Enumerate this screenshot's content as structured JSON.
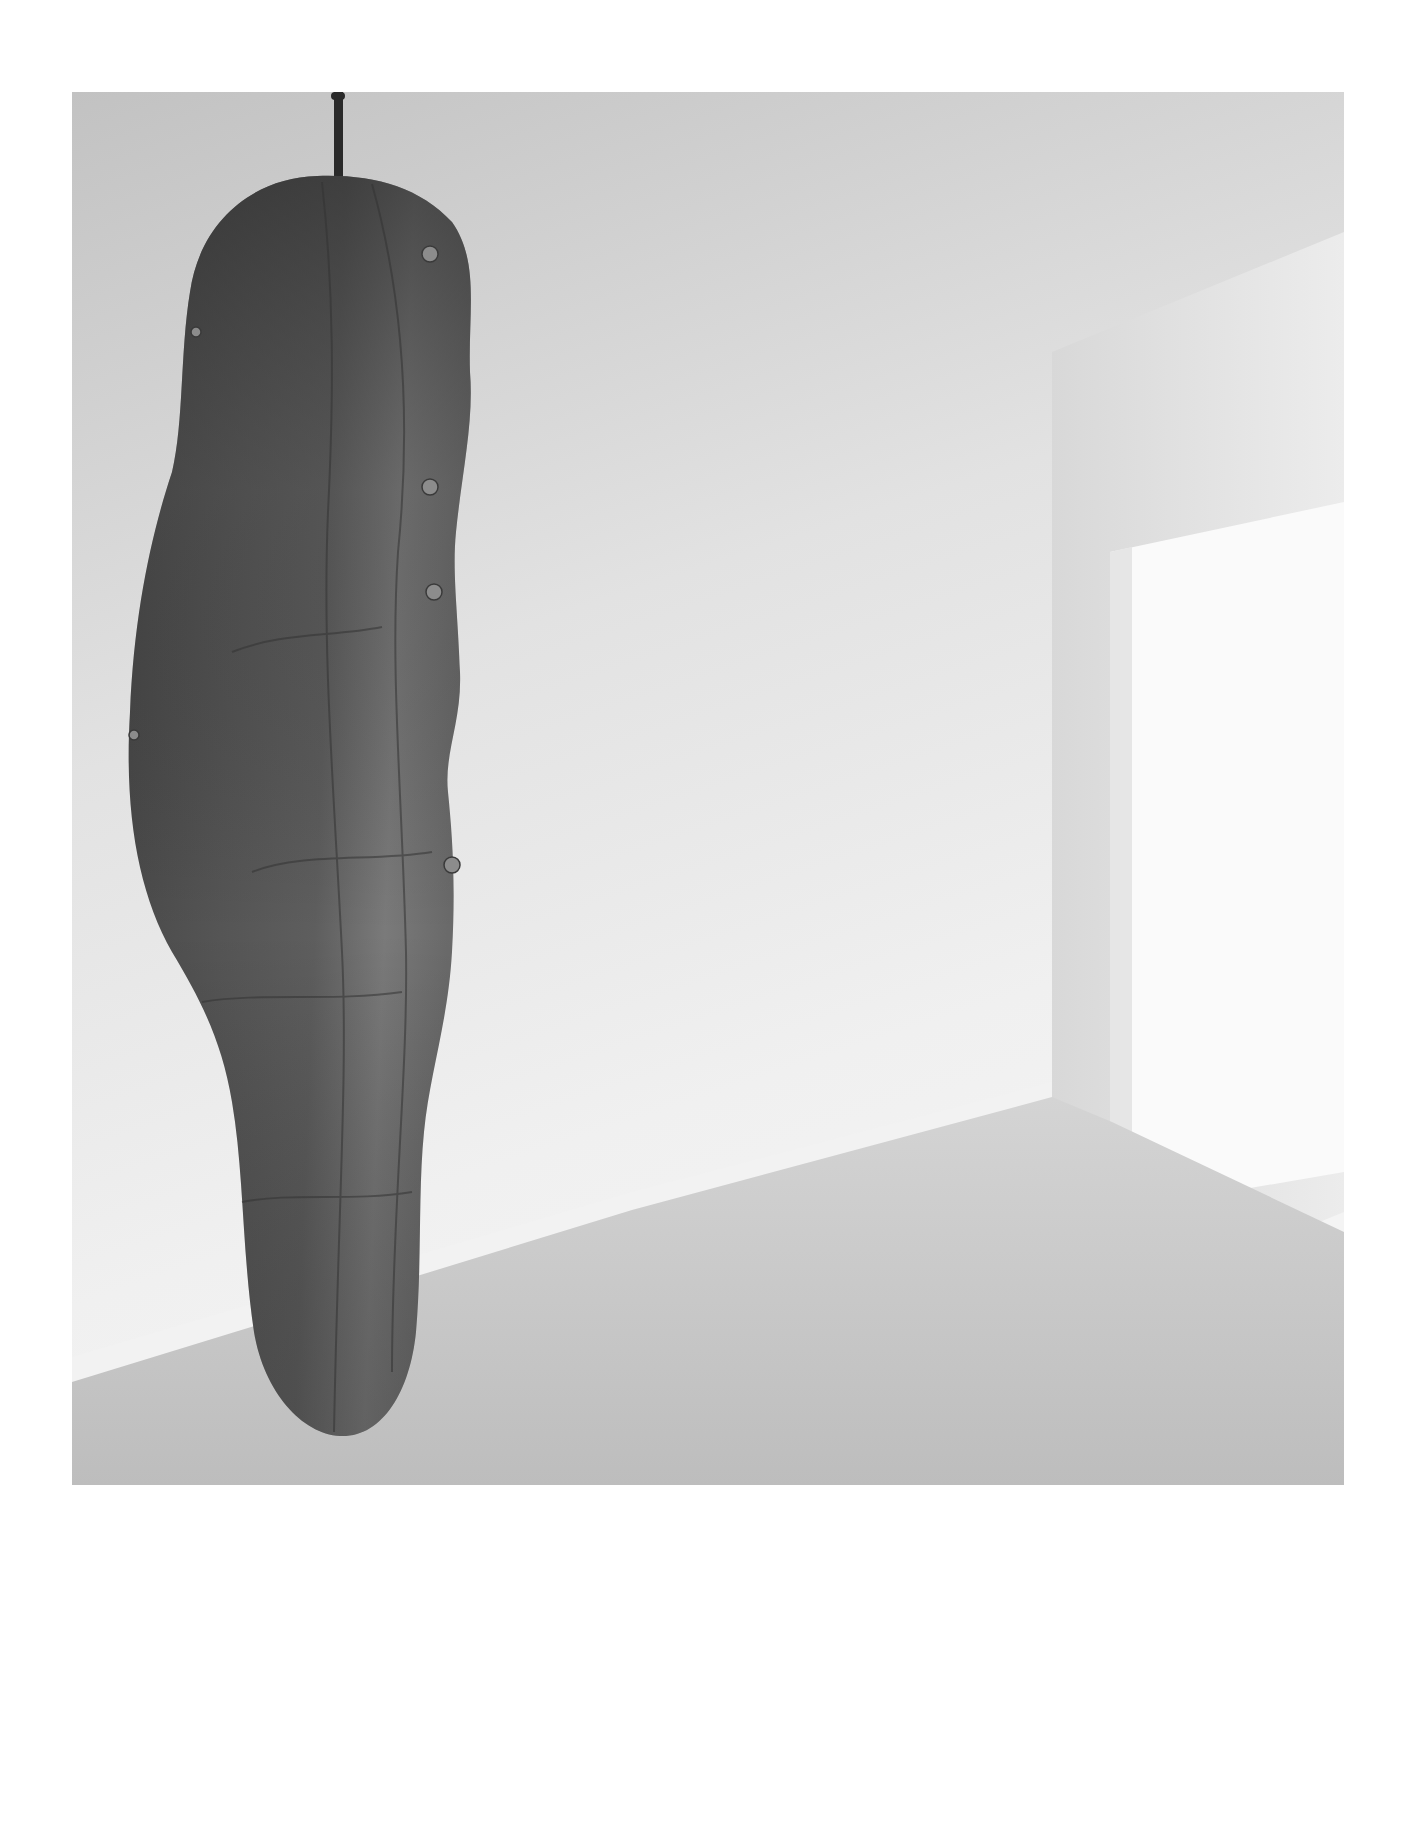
{
  "photo": {
    "subject": "hanging-sculpture",
    "style": "black-and-white photograph",
    "colors": {
      "page_background": "#ffffff",
      "wall_top": "#c4c4c4",
      "wall_light": "#ebebeb",
      "floor": "#c9c9c9",
      "window_light": "#fafafa",
      "sculpture_dark": "#3a3a3a",
      "sculpture_mid": "#5c5c5c",
      "sculpture_light": "#8a8a8a",
      "cable": "#2a2a2a"
    }
  }
}
